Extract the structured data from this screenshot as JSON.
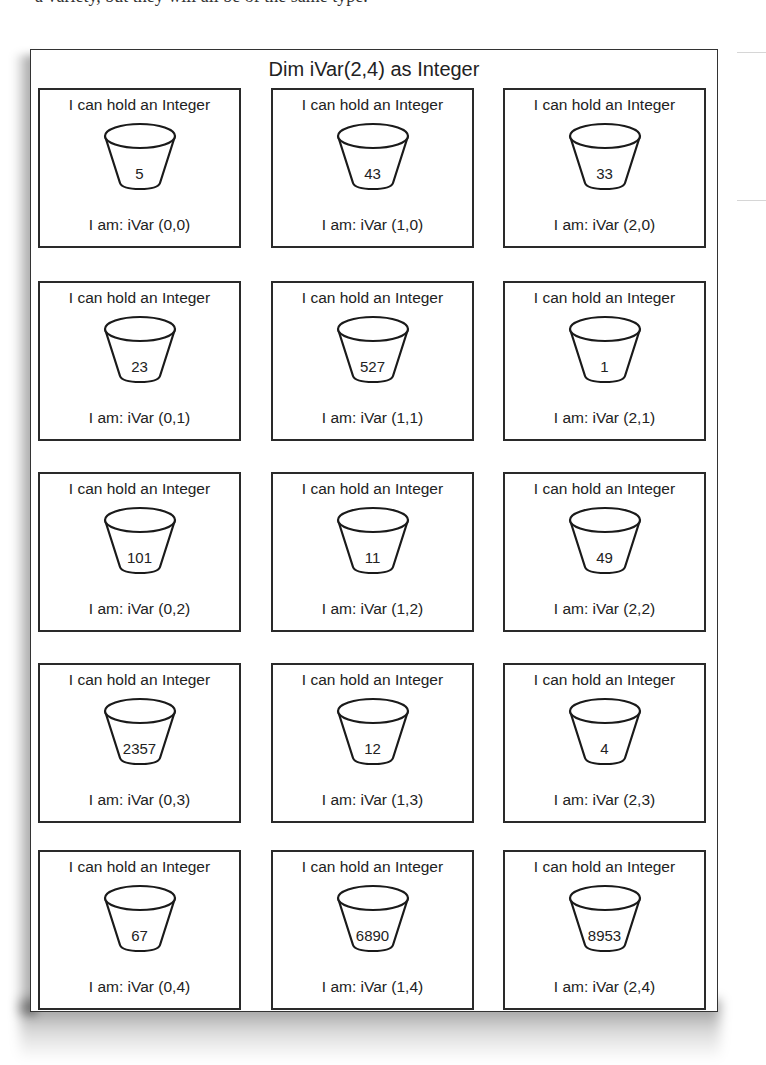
{
  "page_fragment": "a variety, but they will all be of the same type.",
  "diagram": {
    "title": "Dim iVar(2,4) as Integer",
    "cell_caption": "I can hold an Integer",
    "columns": 3,
    "rows": 5,
    "cells": [
      {
        "value": "5",
        "label": "I am: iVar (0,0)"
      },
      {
        "value": "43",
        "label": "I am: iVar (1,0)"
      },
      {
        "value": "33",
        "label": "I am: iVar (2,0)"
      },
      {
        "value": "23",
        "label": "I am: iVar (0,1)"
      },
      {
        "value": "527",
        "label": "I am: iVar (1,1)"
      },
      {
        "value": "1",
        "label": "I am: iVar (2,1)"
      },
      {
        "value": "101",
        "label": "I am: iVar (0,2)"
      },
      {
        "value": "11",
        "label": "I am: iVar (1,2)"
      },
      {
        "value": "49",
        "label": "I am: iVar (2,2)"
      },
      {
        "value": "2357",
        "label": "I am: iVar (0,3)"
      },
      {
        "value": "12",
        "label": "I am: iVar (1,3)"
      },
      {
        "value": "4",
        "label": "I am: iVar (2,3)"
      },
      {
        "value": "67",
        "label": "I am: iVar (0,4)"
      },
      {
        "value": "6890",
        "label": "I am: iVar (1,4)"
      },
      {
        "value": "8953",
        "label": "I am: iVar (2,4)"
      }
    ]
  }
}
